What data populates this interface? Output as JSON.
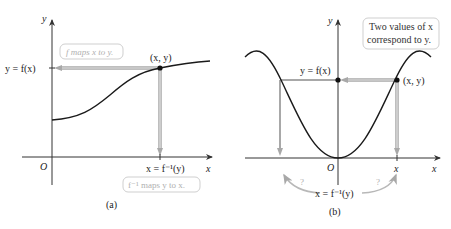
{
  "panel_a": {
    "caption": "(a)",
    "axis_x_label": "x",
    "axis_y_label": "y",
    "origin_label": "O",
    "y_value_label": "y = f(x)",
    "x_value_label": "x = f⁻¹(y)",
    "point_label": "(x, y)",
    "note_forward": "f maps x to y.",
    "note_inverse": "f⁻¹ maps y to x."
  },
  "panel_b": {
    "caption": "(b)",
    "axis_x_label": "x",
    "axis_y_label": "y",
    "origin_label": "O",
    "y_value_label": "y = f(x)",
    "x_tick_label": "x",
    "point_label": "(x, y)",
    "x_value_label": "x = f⁻¹(y)",
    "question_marks": [
      "?",
      "?"
    ],
    "note_two_values": [
      "Two values of x",
      "correspond to y."
    ]
  },
  "colors": {
    "curve": "#1a1a1a",
    "axis": "#333333",
    "mapping_arrow": "#a8a8a8",
    "note_border": "#cfcfcf",
    "note_text": "#b0b0b0"
  }
}
